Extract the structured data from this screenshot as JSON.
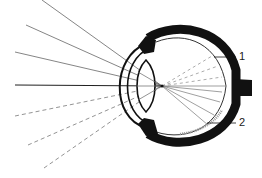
{
  "diagram": {
    "type": "eye cross-section ray diagram",
    "labels": [
      {
        "id": "1",
        "text": "1"
      },
      {
        "id": "2",
        "text": "2"
      }
    ],
    "colors": {
      "line": "#1a1a1a",
      "ray": "#555555",
      "background": "#ffffff"
    }
  }
}
